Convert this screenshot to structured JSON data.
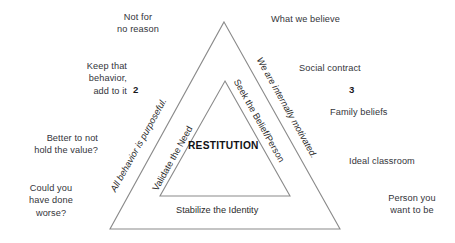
{
  "diagram": {
    "core_label": "RESTITUTION",
    "line_color": "#8a8a8a",
    "text_color": "#2b2b2b"
  },
  "triangle_outer": {
    "apex": {
      "x": 224,
      "y": 22
    },
    "bottom_left": {
      "x": 110,
      "y": 229
    },
    "bottom_right": {
      "x": 340,
      "y": 229
    }
  },
  "triangle_inner": {
    "apex": {
      "x": 225,
      "y": 81
    },
    "bottom_left": {
      "x": 160,
      "y": 196
    },
    "bottom_right": {
      "x": 290,
      "y": 196
    }
  },
  "edge_labels": {
    "outer_left": "All behavior is purposeful.",
    "inner_left": "Validate the Need",
    "outer_right": "We are internally motivated.",
    "inner_right": "Seek the Belief/Person",
    "base": "Stabilize the Identity"
  },
  "numerals": {
    "left": "2",
    "right": "3"
  },
  "left_notes": [
    {
      "name": "not-for-no-reason",
      "text": "Not for\nno reason"
    },
    {
      "name": "keep-that-behavior",
      "text": "Keep that\nbehavior,\nadd to it"
    },
    {
      "name": "better-to-not-hold-the-value",
      "text": "Better to not\nhold the value?"
    },
    {
      "name": "could-you-have-done-worse",
      "text": "Could you\nhave done\nworse?"
    }
  ],
  "right_notes": [
    {
      "name": "what-we-believe",
      "text": "What we believe"
    },
    {
      "name": "social-contract",
      "text": "Social contract"
    },
    {
      "name": "family-beliefs",
      "text": "Family beliefs"
    },
    {
      "name": "ideal-classroom",
      "text": "Ideal classroom"
    },
    {
      "name": "person-you-want-to-be",
      "text": "Person you\nwant to be"
    }
  ]
}
